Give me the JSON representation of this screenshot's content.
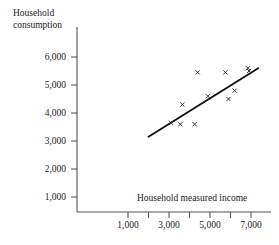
{
  "chart_data": {
    "type": "scatter",
    "title": "",
    "xlabel": "Household measured income",
    "ylabel": "Household consumption",
    "ylabel_line1": "Household",
    "ylabel_line2": "consumption",
    "xlim": [
      0,
      7800
    ],
    "ylim": [
      0,
      6600
    ],
    "grid": false,
    "legend": null,
    "marker": "x",
    "marker_color": "#333333",
    "line_color": "#111111",
    "axis_color": "#555555",
    "xticks": [
      1000,
      3000,
      5000,
      7000
    ],
    "xtick_labels": [
      "1,000",
      "3,000",
      "5,000",
      "7,000"
    ],
    "xminor_ticks": [
      2000,
      4000,
      6000
    ],
    "yticks": [
      1000,
      2000,
      3000,
      4000,
      5000,
      6000
    ],
    "ytick_labels": [
      "1,000",
      "2,000",
      "3,000",
      "4,000",
      "5,000",
      "6,000"
    ],
    "points": [
      {
        "x": 3100,
        "y": 3650
      },
      {
        "x": 3550,
        "y": 3600
      },
      {
        "x": 3650,
        "y": 4300
      },
      {
        "x": 4250,
        "y": 3600
      },
      {
        "x": 4400,
        "y": 5450
      },
      {
        "x": 4900,
        "y": 4600
      },
      {
        "x": 5750,
        "y": 5450
      },
      {
        "x": 5900,
        "y": 4500
      },
      {
        "x": 6200,
        "y": 4800
      },
      {
        "x": 6850,
        "y": 5600
      },
      {
        "x": 6900,
        "y": 5500
      }
    ],
    "fit_line": {
      "name": "regression-line",
      "x_start": 2000,
      "y_start": 3150,
      "x_end": 7350,
      "y_end": 5600
    }
  }
}
